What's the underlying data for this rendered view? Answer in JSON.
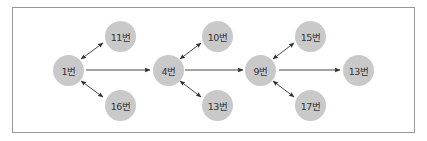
{
  "diagram": {
    "nodes": [
      {
        "id": "n1",
        "label": "1번",
        "x": 68,
        "y": 70
      },
      {
        "id": "n11",
        "label": "11번",
        "x": 120,
        "y": 36
      },
      {
        "id": "n16",
        "label": "16번",
        "x": 120,
        "y": 105
      },
      {
        "id": "n4",
        "label": "4번",
        "x": 168,
        "y": 70
      },
      {
        "id": "n10",
        "label": "10번",
        "x": 217,
        "y": 36
      },
      {
        "id": "n13a",
        "label": "13번",
        "x": 217,
        "y": 105
      },
      {
        "id": "n9",
        "label": "9번",
        "x": 260,
        "y": 70
      },
      {
        "id": "n15",
        "label": "15번",
        "x": 310,
        "y": 36
      },
      {
        "id": "n17",
        "label": "17번",
        "x": 310,
        "y": 105
      },
      {
        "id": "n13b",
        "label": "13번",
        "x": 358,
        "y": 70
      }
    ],
    "edges": [
      {
        "from": "n1",
        "to": "n11",
        "type": "bidirectional"
      },
      {
        "from": "n1",
        "to": "n16",
        "type": "bidirectional"
      },
      {
        "from": "n1",
        "to": "n4",
        "type": "directed"
      },
      {
        "from": "n4",
        "to": "n10",
        "type": "bidirectional"
      },
      {
        "from": "n4",
        "to": "n13a",
        "type": "bidirectional"
      },
      {
        "from": "n4",
        "to": "n9",
        "type": "directed"
      },
      {
        "from": "n9",
        "to": "n15",
        "type": "bidirectional"
      },
      {
        "from": "n9",
        "to": "n17",
        "type": "bidirectional"
      },
      {
        "from": "n9",
        "to": "n13b",
        "type": "directed"
      }
    ],
    "colors": {
      "node_fill": "#c9c9c9",
      "edge": "#333333",
      "frame": "#9a9a9a"
    }
  }
}
